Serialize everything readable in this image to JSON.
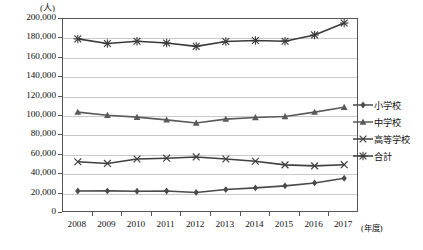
{
  "chart_data": {
    "type": "line",
    "title": "",
    "xlabel": "(年度)",
    "ylabel": "(人)",
    "unit_note": "(人)",
    "categories": [
      "2008",
      "2009",
      "2010",
      "2011",
      "2012",
      "2013",
      "2014",
      "2015",
      "2016",
      "2017"
    ],
    "x": [
      2008,
      2009,
      2010,
      2011,
      2012,
      2013,
      2014,
      2015,
      2016,
      2017
    ],
    "ylim": [
      0,
      200000
    ],
    "ytick_step": 20000,
    "ytick_labels": [
      "200,000",
      "180,000",
      "160,000",
      "140,000",
      "120,000",
      "100,000",
      "80,000",
      "60,000",
      "40,000",
      "20,000",
      "0"
    ],
    "ytick_values": [
      200000,
      180000,
      160000,
      140000,
      120000,
      100000,
      80000,
      60000,
      40000,
      20000,
      0
    ],
    "grid": true,
    "grid_axis": "y",
    "legend_position": "right",
    "series": [
      {
        "name": "小学校",
        "marker": "diamond",
        "color": "#4a4a4a",
        "values": [
          22700,
          22800,
          22500,
          22700,
          21200,
          24200,
          25900,
          28000,
          31000,
          35800
        ]
      },
      {
        "name": "中学校",
        "marker": "triangle",
        "color": "#5a5a5a",
        "values": [
          104000,
          100800,
          98800,
          96000,
          92800,
          96800,
          98500,
          99500,
          104000,
          109000
        ]
      },
      {
        "name": "高等学校",
        "marker": "x",
        "color": "#3f3f3f",
        "values": [
          52800,
          51100,
          55700,
          56500,
          57800,
          55700,
          53400,
          49600,
          48600,
          49800
        ]
      },
      {
        "name": "合計",
        "marker": "asterisk",
        "color": "#3a3a3a",
        "values": [
          179500,
          174700,
          177000,
          175200,
          171800,
          176800,
          177800,
          177100,
          183600,
          195800
        ]
      }
    ]
  },
  "axis": {
    "y_unit": "(人)",
    "x_unit": "(年度)"
  },
  "legend": {
    "items": [
      {
        "label": "小学校",
        "marker": "diamond"
      },
      {
        "label": "中学校",
        "marker": "triangle"
      },
      {
        "label": "高等学校",
        "marker": "x"
      },
      {
        "label": "合計",
        "marker": "asterisk"
      }
    ]
  }
}
